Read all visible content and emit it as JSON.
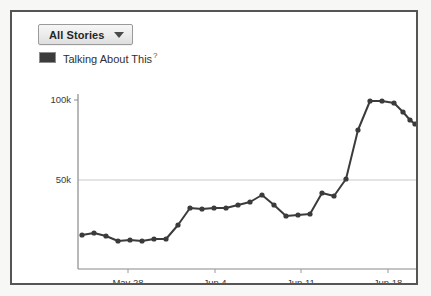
{
  "panel": {
    "name": "insights-chart-panel"
  },
  "toolbar": {
    "dropdown_label": "All Stories",
    "dropdown_caret_icon": "chevron-down-icon"
  },
  "legend": {
    "swatch_color": "#3b3b3b",
    "label": "Talking About This",
    "help_marker": "?"
  },
  "chart_data": {
    "type": "line",
    "title": "",
    "xlabel": "",
    "ylabel": "",
    "series_name": "Talking About This",
    "line_color": "#3b3b3b",
    "marker_color": "#3b3b3b",
    "grid": true,
    "gridlines": [
      50000
    ],
    "legend_position": "top-left",
    "ylim": [
      0,
      110000
    ],
    "ytick_values": [
      50000,
      100000
    ],
    "ytick_labels": [
      "50k",
      "100k"
    ],
    "xtick_labels": [
      "May 28",
      "Jun 4",
      "Jun 11",
      "Jun 18"
    ],
    "xtick_x": [
      116,
      203,
      289,
      376
    ],
    "x": [
      "May 23",
      "May 24",
      "May 25",
      "May 26",
      "May 27",
      "May 28",
      "May 29",
      "May 30",
      "May 31",
      "Jun 1",
      "Jun 2",
      "Jun 3",
      "Jun 4",
      "Jun 5",
      "Jun 6",
      "Jun 7",
      "Jun 8",
      "Jun 9",
      "Jun 10",
      "Jun 11",
      "Jun 12",
      "Jun 13",
      "Jun 14",
      "Jun 15",
      "Jun 16",
      "Jun 17",
      "Jun 18",
      "Jun 19",
      "Jun 20",
      "Jun 21"
    ],
    "values": [
      19000,
      20000,
      18500,
      16000,
      16500,
      16000,
      17000,
      17000,
      25000,
      32000,
      31000,
      32500,
      32500,
      35000,
      37000,
      41000,
      35000,
      28000,
      28500,
      29500,
      41000,
      39000,
      49000,
      78000,
      96000,
      96000,
      94000,
      94000,
      86000,
      83000
    ],
    "points_px": [
      [
        70,
        223
      ],
      [
        82,
        221
      ],
      [
        94,
        224
      ],
      [
        106,
        229
      ],
      [
        118,
        228
      ],
      [
        130,
        229
      ],
      [
        142,
        227
      ],
      [
        154,
        227
      ],
      [
        166,
        213
      ],
      [
        178,
        196
      ],
      [
        190,
        197
      ],
      [
        202,
        196
      ],
      [
        214,
        196
      ],
      [
        226,
        193
      ],
      [
        238,
        190
      ],
      [
        250,
        183
      ],
      [
        262,
        193
      ],
      [
        274,
        204
      ],
      [
        286,
        203
      ],
      [
        298,
        202
      ],
      [
        310,
        181
      ],
      [
        322,
        184
      ],
      [
        334,
        167
      ],
      [
        346,
        118
      ],
      [
        358,
        89
      ],
      [
        370,
        89
      ],
      [
        382,
        91
      ],
      [
        391,
        100
      ],
      [
        398,
        108
      ],
      [
        403,
        112
      ]
    ],
    "axis_px": {
      "x_axis_y": 257,
      "y_axis_x": 66,
      "plot_top": 82,
      "plot_right": 404,
      "gridline_50k_y": 168,
      "tick_100k_y": 88
    }
  }
}
